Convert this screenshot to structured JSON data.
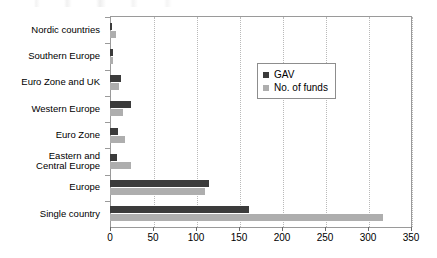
{
  "chart_data": {
    "type": "bar",
    "orientation": "horizontal",
    "title": "",
    "xlabel": "",
    "ylabel": "",
    "xlim": [
      0,
      350
    ],
    "xticks": [
      0,
      50,
      100,
      150,
      200,
      250,
      300,
      350
    ],
    "xtick_labels": [
      "0",
      "50",
      "100",
      "150",
      "200",
      "250",
      "300",
      "350"
    ],
    "grid": "vertical-dotted",
    "legend_position": "inside-upper-right",
    "categories": [
      "Nordic countries",
      "Southern Europe",
      "Euro Zone and UK",
      "Western Europe",
      "Euro Zone",
      "Eastern and\nCentral Europe",
      "Europe",
      "Single country"
    ],
    "series": [
      {
        "name": "GAV",
        "color": "#3b3b3b",
        "values": [
          2,
          4,
          13,
          24,
          9,
          8,
          115,
          162
        ]
      },
      {
        "name": "No. of funds",
        "color": "#aeaeae",
        "values": [
          7,
          3,
          10,
          15,
          17,
          24,
          110,
          318
        ]
      }
    ]
  },
  "legend": {
    "items": [
      {
        "label": "GAV",
        "swatch": "#3b3b3b"
      },
      {
        "label": "No. of funds",
        "swatch": "#aeaeae"
      }
    ]
  }
}
